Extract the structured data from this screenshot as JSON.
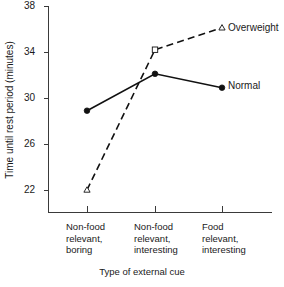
{
  "chart_data": {
    "type": "line",
    "title": "",
    "xlabel": "Type of external cue",
    "ylabel": "Time until rest period (minutes)",
    "categories": [
      "Non-food relevant, boring",
      "Non-food relevant, interesting",
      "Food relevant, interesting"
    ],
    "category_lines": [
      [
        "Non-food",
        "relevant,",
        "boring"
      ],
      [
        "Non-food",
        "relevant,",
        "interesting"
      ],
      [
        "Food",
        "relevant,",
        "interesting"
      ]
    ],
    "series": [
      {
        "name": "Overweight",
        "values": [
          22.0,
          34.2,
          36.1
        ],
        "marker": "open-triangle",
        "linestyle": "dashed",
        "color": "#111111"
      },
      {
        "name": "Normal",
        "values": [
          28.9,
          32.1,
          30.9
        ],
        "marker": "filled-circle",
        "linestyle": "solid",
        "color": "#111111"
      }
    ],
    "ylim": [
      20.0,
      38.0
    ],
    "yticks": [
      22,
      26,
      30,
      34,
      38
    ],
    "ytick_labels": [
      "22",
      "26",
      "30",
      "34",
      "38"
    ],
    "grid": false,
    "legend_position": "inline-right-of-last-point"
  },
  "labels": {
    "ytick_0": "22",
    "ytick_1": "26",
    "ytick_2": "30",
    "ytick_3": "34",
    "ytick_4": "38",
    "y_axis_title": "Time until rest period (minutes)",
    "x_axis_title": "Type of external cue",
    "series_overweight": "Overweight",
    "series_normal": "Normal",
    "cat0_line0": "Non-food",
    "cat0_line1": "relevant,",
    "cat0_line2": "boring",
    "cat1_line0": "Non-food",
    "cat1_line1": "relevant,",
    "cat1_line2": "interesting",
    "cat2_line0": "Food",
    "cat2_line1": "relevant,",
    "cat2_line2": "interesting"
  }
}
